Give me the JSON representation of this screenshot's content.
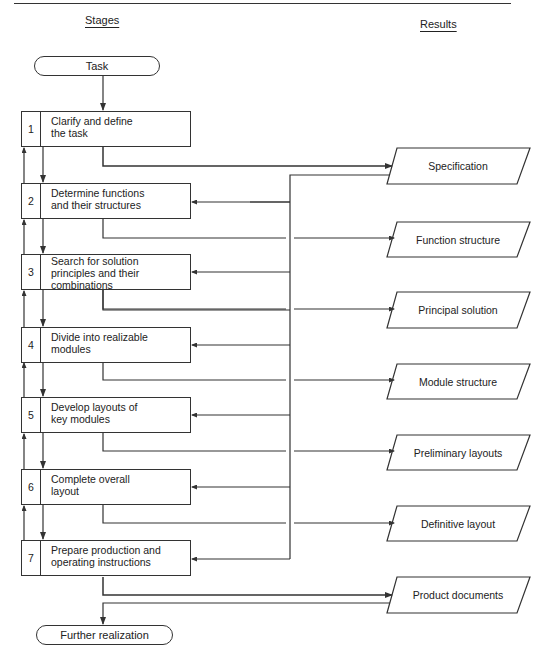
{
  "headers": {
    "stages": "Stages",
    "results": "Results"
  },
  "start": {
    "label": "Task"
  },
  "end": {
    "label": "Further realization"
  },
  "stages": [
    {
      "num": "1",
      "label": "Clarify and define\nthe task"
    },
    {
      "num": "2",
      "label": "Determine functions\nand their structures"
    },
    {
      "num": "3",
      "label": "Search for solution\nprinciples and their\ncombinations"
    },
    {
      "num": "4",
      "label": "Divide into realizable\nmodules"
    },
    {
      "num": "5",
      "label": "Develop layouts of\nkey modules"
    },
    {
      "num": "6",
      "label": "Complete overall\nlayout"
    },
    {
      "num": "7",
      "label": "Prepare production and\noperating instructions"
    }
  ],
  "results": [
    {
      "label": "Specification"
    },
    {
      "label": "Function structure"
    },
    {
      "label": "Principal solution"
    },
    {
      "label": "Module structure"
    },
    {
      "label": "Preliminary layouts"
    },
    {
      "label": "Definitive layout"
    },
    {
      "label": "Product documents"
    }
  ],
  "colors": {
    "line": "#333333",
    "background": "#ffffff"
  }
}
